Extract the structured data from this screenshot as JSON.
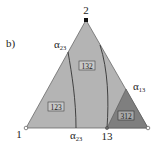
{
  "panel_label": "b)",
  "vertices": {
    "top": "2",
    "left": "1",
    "bottom_mid": "13"
  },
  "alpha_labels": {
    "left_edge": {
      "base": "α",
      "sub": "23"
    },
    "bottom_edge": {
      "base": "α",
      "sub": "23"
    },
    "right_edge": {
      "base": "α",
      "sub": "13"
    }
  },
  "regions": [
    {
      "label": "123",
      "color": "#b4b4b4"
    },
    {
      "label": "132",
      "color": "#b4b4b4"
    },
    {
      "label": "312",
      "color": "#7f7f7f"
    }
  ],
  "colors": {
    "triangle_fill": "#b4b4b4",
    "dark_region": "#7f7f7f",
    "edge": "#555555",
    "curve": "#333333"
  }
}
